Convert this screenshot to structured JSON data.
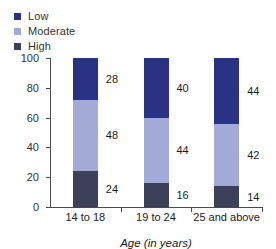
{
  "chart_data": {
    "type": "bar",
    "stacked": true,
    "title": "",
    "xlabel": "Age (in years)",
    "ylabel": "",
    "ylim": [
      0,
      100
    ],
    "yticks": [
      0,
      20,
      40,
      60,
      80,
      100
    ],
    "grid": false,
    "legend_position": "top-left",
    "categories": [
      "14 to 18",
      "19 to 24",
      "25 and above"
    ],
    "series": [
      {
        "name": "Low",
        "color": "#2a3285",
        "values": [
          28,
          40,
          44
        ]
      },
      {
        "name": "Moderate",
        "color": "#a3aad8",
        "values": [
          48,
          44,
          42
        ]
      },
      {
        "name": "High",
        "color": "#3c4159",
        "values": [
          24,
          16,
          14
        ]
      }
    ],
    "data_labels": {
      "14 to 18": {
        "Low": "28",
        "Moderate": "48",
        "High": "24"
      },
      "19 to 24": {
        "Low": "40",
        "Moderate": "44",
        "High": "16"
      },
      "25 and above": {
        "Low": "44",
        "Moderate": "42",
        "High": "14"
      }
    }
  },
  "legend": {
    "items": [
      {
        "label": "Low",
        "color": "#2a3285"
      },
      {
        "label": "Moderate",
        "color": "#a3aad8"
      },
      {
        "label": "High",
        "color": "#3c4159"
      }
    ]
  },
  "axes": {
    "y_tick_labels": [
      "100",
      "80",
      "60",
      "40",
      "20",
      "0"
    ],
    "x_tick_labels": [
      "14 to 18",
      "19 to 24",
      "25 and above"
    ],
    "x_axis_title": "Age (in years)"
  }
}
